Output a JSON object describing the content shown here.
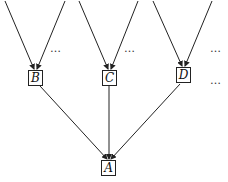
{
  "diagram": {
    "type": "tree",
    "nodes": [
      {
        "id": "B",
        "label": "B"
      },
      {
        "id": "C",
        "label": "C"
      },
      {
        "id": "D",
        "label": "D"
      },
      {
        "id": "A",
        "label": "A"
      }
    ],
    "edges": [
      {
        "from": "top-left-1",
        "to": "B"
      },
      {
        "from": "top-left-2",
        "to": "B"
      },
      {
        "from": "top-mid-1",
        "to": "C"
      },
      {
        "from": "top-mid-2",
        "to": "C"
      },
      {
        "from": "top-right-1",
        "to": "D"
      },
      {
        "from": "top-right-2",
        "to": "D"
      },
      {
        "from": "B",
        "to": "A"
      },
      {
        "from": "C",
        "to": "A"
      },
      {
        "from": "D",
        "to": "A"
      }
    ],
    "ellipses": [
      "…",
      "…",
      "…",
      "…"
    ]
  }
}
